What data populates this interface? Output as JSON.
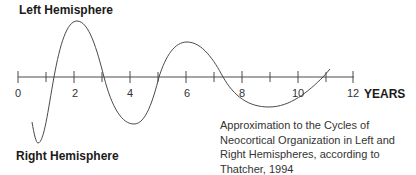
{
  "diagram": {
    "top_label": "Left Hemisphere",
    "bottom_label": "Right Hemisphere",
    "axis_unit_label": "YEARS",
    "caption": "Approximation to the Cycles of Neocortical Organization in Left and Right Hemispheres, according to Thatcher, 1994",
    "axis": {
      "min": 0,
      "max": 12,
      "major_tick_labels": [
        "0",
        "2",
        "4",
        "6",
        "8",
        "10",
        "12"
      ],
      "minor_ticks": [
        1,
        3,
        5,
        7,
        9,
        11
      ]
    },
    "curve": {
      "description": "Damped oscillating wave alternating between left (above axis) and right (below axis) hemisphere dominance",
      "extrema": [
        {
          "year": 0.7,
          "side": "right",
          "label": "trough"
        },
        {
          "year": 2.1,
          "side": "left",
          "label": "peak"
        },
        {
          "year": 4.1,
          "side": "right",
          "label": "trough"
        },
        {
          "year": 6.1,
          "side": "left",
          "label": "peak"
        },
        {
          "year": 9.0,
          "side": "right",
          "label": "trough"
        }
      ],
      "axis_crossings": [
        1.3,
        3.1,
        5.0,
        7.3,
        10.9
      ]
    },
    "colors": {
      "line": "#4a4a4a",
      "text": "#1a1a1a"
    }
  }
}
